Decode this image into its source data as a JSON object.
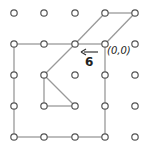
{
  "diagram": {
    "type": "geoboard-grid",
    "grid": {
      "cols": 5,
      "rows": 5,
      "x": [
        14,
        44,
        75,
        105,
        135
      ],
      "y": [
        13,
        44,
        75,
        106,
        137
      ]
    },
    "line_color": "#999999",
    "dot_color": "#555555",
    "edges": [
      [
        [
          0,
          1
        ],
        [
          1,
          1
        ]
      ],
      [
        [
          1,
          1
        ],
        [
          2,
          1
        ]
      ],
      [
        [
          2,
          1
        ],
        [
          3,
          1
        ]
      ],
      [
        [
          0,
          1
        ],
        [
          0,
          2
        ]
      ],
      [
        [
          0,
          2
        ],
        [
          0,
          3
        ]
      ],
      [
        [
          0,
          3
        ],
        [
          0,
          4
        ]
      ],
      [
        [
          0,
          4
        ],
        [
          1,
          4
        ]
      ],
      [
        [
          1,
          4
        ],
        [
          2,
          4
        ]
      ],
      [
        [
          2,
          4
        ],
        [
          3,
          4
        ]
      ],
      [
        [
          3,
          1
        ],
        [
          3,
          2
        ]
      ],
      [
        [
          3,
          2
        ],
        [
          3,
          3
        ]
      ],
      [
        [
          3,
          3
        ],
        [
          3,
          4
        ]
      ],
      [
        [
          3,
          0
        ],
        [
          4,
          0
        ]
      ],
      [
        [
          4,
          0
        ],
        [
          3,
          1
        ]
      ],
      [
        [
          3,
          0
        ],
        [
          2,
          1
        ]
      ],
      [
        [
          2,
          1
        ],
        [
          1,
          2
        ]
      ],
      [
        [
          1,
          2
        ],
        [
          1,
          3
        ]
      ],
      [
        [
          1,
          3
        ],
        [
          2,
          3
        ]
      ],
      [
        [
          2,
          3
        ],
        [
          1,
          2
        ]
      ]
    ],
    "labels": {
      "origin": "(0,0)",
      "arrow_number": "6"
    },
    "arrow": {
      "from": [
        98,
        52
      ],
      "to": [
        81,
        52
      ]
    }
  }
}
